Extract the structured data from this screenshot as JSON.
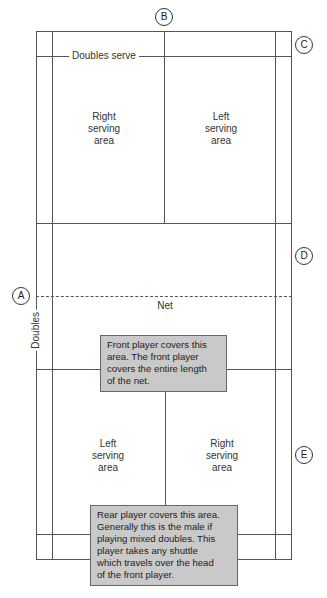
{
  "markers": {
    "a": "A",
    "b": "B",
    "c": "C",
    "d": "D",
    "e": "E"
  },
  "labels": {
    "doubles_serve": "Doubles serve",
    "doubles": "Doubles",
    "net": "Net"
  },
  "top_half": {
    "right_area": [
      "Right",
      "serving",
      "area"
    ],
    "left_area": [
      "Left",
      "serving",
      "area"
    ]
  },
  "bottom_half": {
    "left_area": [
      "Left",
      "serving",
      "area"
    ],
    "right_area": [
      "Right",
      "serving",
      "area"
    ]
  },
  "callouts": {
    "front_player": [
      "Front player covers this",
      "area. The front player",
      "covers the entire length",
      "of the net."
    ],
    "rear_player": [
      "Rear player covers this area.",
      "Generally this is the male if",
      "playing mixed doubles. This",
      "player takes any shuttle",
      "which travels over the head",
      "of the front player."
    ]
  }
}
